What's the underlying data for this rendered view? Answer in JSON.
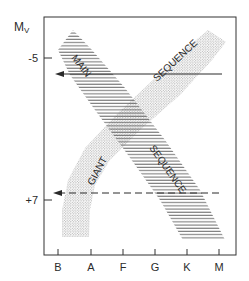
{
  "figure": {
    "type": "Hertzsprung-Russell schematic diagram",
    "y_axis": {
      "label": "M",
      "label_subscript": "V",
      "ticks": [
        {
          "label": "-5",
          "y": 58
        },
        {
          "label": "+7",
          "y": 200
        }
      ]
    },
    "x_axis": {
      "ticks": [
        {
          "label": "B",
          "x": 58
        },
        {
          "label": "A",
          "x": 91
        },
        {
          "label": "F",
          "x": 123
        },
        {
          "label": "G",
          "x": 155
        },
        {
          "label": "K",
          "x": 187
        },
        {
          "label": "M",
          "x": 219
        }
      ]
    },
    "bands": {
      "main_sequence": {
        "fill": "horizontal hatching",
        "labels": [
          "MAIN",
          "SEQUENCE"
        ]
      },
      "giant_sequence": {
        "fill": "stipple dots",
        "labels": [
          "GIANT",
          "SEQUENCE"
        ]
      }
    },
    "arrows": [
      {
        "style": "solid",
        "direction": "left",
        "y": 74
      },
      {
        "style": "dashed",
        "direction": "left",
        "y": 193
      }
    ],
    "colors": {
      "ink": "#2a2a2a",
      "hatch": "#555555",
      "stipple": "#8a8a8a",
      "background": "#ffffff"
    }
  }
}
